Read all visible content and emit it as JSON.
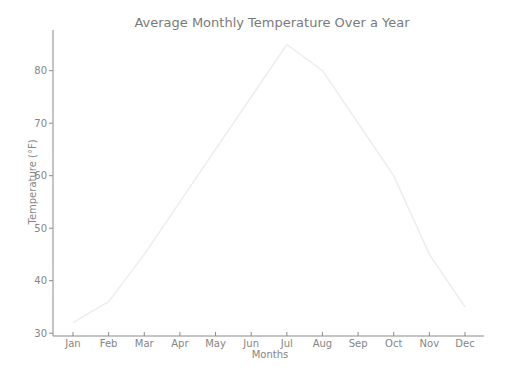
{
  "chart_data": {
    "type": "line",
    "title": "Average Monthly Temperature Over a Year",
    "xlabel": "Months",
    "ylabel": "Temperature (°F)",
    "categories": [
      "Jan",
      "Feb",
      "Mar",
      "Apr",
      "May",
      "Jun",
      "Jul",
      "Aug",
      "Sep",
      "Oct",
      "Nov",
      "Dec"
    ],
    "series": [
      {
        "name": "Temperature",
        "values": [
          32,
          36,
          45,
          55,
          65,
          75,
          85,
          80,
          70,
          60,
          45,
          35
        ],
        "color": "#eeeeee"
      }
    ],
    "yticks": [
      30,
      40,
      50,
      60,
      70,
      80
    ],
    "ylim": [
      29.5,
      88
    ],
    "grid": false,
    "legend": null
  },
  "colors": {
    "axis": "#8a8a8a",
    "text": "#858585",
    "line": "#eeeeee"
  }
}
